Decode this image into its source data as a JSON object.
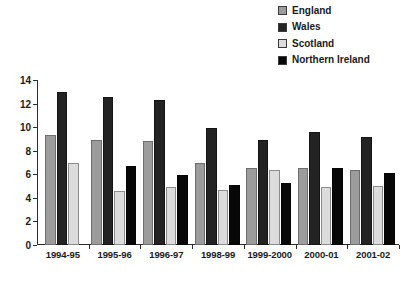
{
  "title": "",
  "legend": {
    "position": "top-right",
    "entries": [
      {
        "label": "England",
        "color": "#9c9c9c"
      },
      {
        "label": "Wales",
        "color": "#232323"
      },
      {
        "label": "Scotland",
        "color": "#dcdcdc"
      },
      {
        "label": "Northern Ireland",
        "color": "#080808"
      }
    ]
  },
  "axis": {
    "y_ticks": [
      "0",
      "2",
      "4",
      "6",
      "8",
      "10",
      "12",
      "14"
    ],
    "x_labels": [
      "1994-95",
      "1995-96",
      "1996-97",
      "1998-99",
      "1999-2000",
      "2000-01",
      "2001-02"
    ]
  },
  "chart_data": {
    "type": "bar",
    "title": "",
    "xlabel": "",
    "ylabel": "",
    "ylim": [
      0,
      14
    ],
    "ytick_step": 2,
    "grid": false,
    "legend_position": "top-right",
    "categories": [
      "1994-95",
      "1995-96",
      "1996-97",
      "1998-99",
      "1999-2000",
      "2000-01",
      "2001-02"
    ],
    "series": [
      {
        "name": "England",
        "color": "#9c9c9c",
        "values": [
          9.3,
          8.9,
          8.8,
          7.0,
          6.5,
          6.5,
          6.4
        ]
      },
      {
        "name": "Wales",
        "color": "#232323",
        "values": [
          13.0,
          12.6,
          12.3,
          9.9,
          8.9,
          9.6,
          9.2
        ]
      },
      {
        "name": "Scotland",
        "color": "#dcdcdc",
        "values": [
          7.0,
          4.6,
          4.9,
          4.7,
          6.4,
          4.9,
          5.0
        ]
      },
      {
        "name": "Northern Ireland",
        "color": "#080808",
        "values": [
          null,
          6.7,
          5.9,
          5.1,
          5.3,
          6.5,
          6.1
        ]
      }
    ]
  }
}
